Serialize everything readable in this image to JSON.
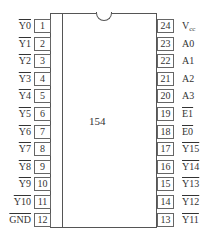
{
  "chip": {
    "name": "154",
    "pin_count": 24
  },
  "left_pins": [
    {
      "number": "1",
      "label": "Y0",
      "active_low": true
    },
    {
      "number": "2",
      "label": "Y1",
      "active_low": true
    },
    {
      "number": "3",
      "label": "Y2",
      "active_low": true
    },
    {
      "number": "4",
      "label": "Y3",
      "active_low": true
    },
    {
      "number": "5",
      "label": "Y4",
      "active_low": true
    },
    {
      "number": "6",
      "label": "Y5",
      "active_low": true
    },
    {
      "number": "7",
      "label": "Y6",
      "active_low": true
    },
    {
      "number": "8",
      "label": "Y7",
      "active_low": true
    },
    {
      "number": "9",
      "label": "Y8",
      "active_low": true
    },
    {
      "number": "10",
      "label": "Y9",
      "active_low": true
    },
    {
      "number": "11",
      "label": "Y10",
      "active_low": true
    },
    {
      "number": "12",
      "label": "GND",
      "active_low": true
    }
  ],
  "right_pins": [
    {
      "number": "24",
      "label": "V",
      "sub": "cc",
      "active_low": false
    },
    {
      "number": "23",
      "label": "A0",
      "active_low": false
    },
    {
      "number": "22",
      "label": "A1",
      "active_low": false
    },
    {
      "number": "21",
      "label": "A2",
      "active_low": false
    },
    {
      "number": "20",
      "label": "A3",
      "active_low": false
    },
    {
      "number": "19",
      "label": "E1",
      "active_low": true
    },
    {
      "number": "18",
      "label": "E0",
      "active_low": true
    },
    {
      "number": "17",
      "label": "Y15",
      "active_low": true
    },
    {
      "number": "16",
      "label": "Y14",
      "active_low": true
    },
    {
      "number": "15",
      "label": "Y13",
      "active_low": true
    },
    {
      "number": "14",
      "label": "Y12",
      "active_low": true
    },
    {
      "number": "13",
      "label": "Y11",
      "active_low": true
    }
  ]
}
